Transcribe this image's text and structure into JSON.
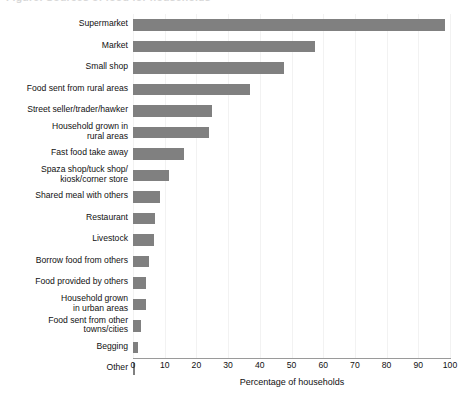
{
  "chart_data": {
    "type": "bar",
    "orientation": "horizontal",
    "title": "Figure: Sources of food for households",
    "xlabel": "Percentage of households",
    "ylabel": "",
    "xlim": [
      0,
      100
    ],
    "xticks": [
      "0",
      "10",
      "20",
      "30",
      "40",
      "50",
      "60",
      "70",
      "80",
      "90",
      "100"
    ],
    "grid": "vertical",
    "legend": "none",
    "bar_color": "#808080",
    "categories": [
      "Supermarket",
      "Market",
      "Small shop",
      "Food sent from rural areas",
      "Street seller/trader/hawker",
      "Household grown in\nrural areas",
      "Fast food take away",
      "Spaza shop/tuck shop/\nkiosk/corner store",
      "Shared meal with others",
      "Restaurant",
      "Livestock",
      "Borrow food from others",
      "Food provided by others",
      "Household grown\nin urban areas",
      "Food sent from other\ntowns/cities",
      "Begging",
      "Other"
    ],
    "values": [
      98.5,
      57.5,
      47.5,
      37,
      25,
      24,
      16,
      11.5,
      8.5,
      7,
      6.5,
      5,
      4,
      4,
      2.5,
      1.5,
      0.5
    ]
  }
}
